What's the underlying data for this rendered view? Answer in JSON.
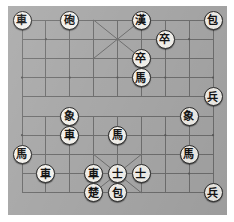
{
  "app": {
    "title": "Xiangqi Board",
    "board_color": "#a8a8a8",
    "line_color": "#6f6f6f",
    "piece_face_color": "#f3f1ec",
    "piece_edge_color": "#2b2b2b",
    "piece_text_color": "#141414"
  },
  "board": {
    "files": 9,
    "ranks": 10,
    "river_present": true,
    "palace_top": true,
    "palace_bottom": true
  },
  "pieces": [
    {
      "id": "p1",
      "glyph": "車",
      "name": "chariot",
      "side": "black",
      "file": 0,
      "rank": 0
    },
    {
      "id": "p2",
      "glyph": "砲",
      "name": "cannon",
      "side": "black",
      "file": 2,
      "rank": 0
    },
    {
      "id": "p3",
      "glyph": "漢",
      "name": "general-han",
      "side": "black",
      "file": 5,
      "rank": 0
    },
    {
      "id": "p4",
      "glyph": "包",
      "name": "cannon",
      "side": "black",
      "file": 8,
      "rank": 0
    },
    {
      "id": "p5",
      "glyph": "卒",
      "name": "soldier",
      "side": "black",
      "file": 6,
      "rank": 1
    },
    {
      "id": "p6",
      "glyph": "卒",
      "name": "soldier",
      "side": "black",
      "file": 5,
      "rank": 2
    },
    {
      "id": "p7",
      "glyph": "馬",
      "name": "horse",
      "side": "black",
      "file": 5,
      "rank": 3
    },
    {
      "id": "p8",
      "glyph": "兵",
      "name": "soldier",
      "side": "red",
      "file": 8,
      "rank": 4
    },
    {
      "id": "p9",
      "glyph": "象",
      "name": "elephant",
      "side": "red",
      "file": 7,
      "rank": 5
    },
    {
      "id": "p10",
      "glyph": "象",
      "name": "elephant",
      "side": "black",
      "file": 2,
      "rank": 5
    },
    {
      "id": "p11",
      "glyph": "車",
      "name": "chariot",
      "side": "black",
      "file": 2,
      "rank": 6
    },
    {
      "id": "p12",
      "glyph": "馬",
      "name": "horse",
      "side": "red",
      "file": 4,
      "rank": 6
    },
    {
      "id": "p13",
      "glyph": "馬",
      "name": "horse",
      "side": "red",
      "file": 7,
      "rank": 7
    },
    {
      "id": "p14",
      "glyph": "馬",
      "name": "horse",
      "side": "red",
      "file": 0,
      "rank": 7
    },
    {
      "id": "p15",
      "glyph": "車",
      "name": "chariot",
      "side": "red",
      "file": 1,
      "rank": 8
    },
    {
      "id": "p16",
      "glyph": "車",
      "name": "chariot",
      "side": "red",
      "file": 3,
      "rank": 8
    },
    {
      "id": "p17",
      "glyph": "士",
      "name": "advisor",
      "side": "red",
      "file": 4,
      "rank": 8
    },
    {
      "id": "p18",
      "glyph": "士",
      "name": "advisor",
      "side": "red",
      "file": 5,
      "rank": 8
    },
    {
      "id": "p19",
      "glyph": "楚",
      "name": "general-chu",
      "side": "red",
      "file": 3,
      "rank": 9
    },
    {
      "id": "p20",
      "glyph": "包",
      "name": "cannon",
      "side": "red",
      "file": 4,
      "rank": 9
    },
    {
      "id": "p21",
      "glyph": "兵",
      "name": "soldier",
      "side": "red",
      "file": 8,
      "rank": 9
    }
  ]
}
